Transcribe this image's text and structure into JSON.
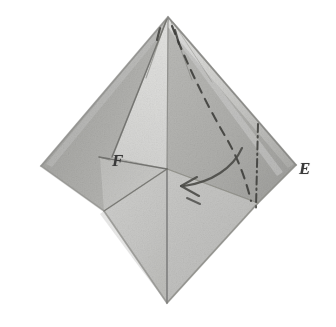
{
  "figure": {
    "kind": "origami-fold-diagram",
    "caption_visible": false,
    "background_color": "#ffffff",
    "labels": [
      {
        "id": "F",
        "text": "F",
        "x": 112,
        "y": 152
      },
      {
        "id": "E",
        "text": "E",
        "x": 299,
        "y": 160
      }
    ],
    "geometry": {
      "apex": [
        168,
        16
      ],
      "left_corner": [
        40,
        166
      ],
      "right_corner": [
        296,
        164
      ],
      "bottom_vertex": [
        167,
        303
      ],
      "center_vertex": [
        167,
        170
      ],
      "f_flap_outer": [
        100,
        158
      ],
      "f_flap_lower": [
        104,
        210
      ]
    },
    "palette": {
      "paper_light": "#dcdcda",
      "paper_midlight": "#cacac8",
      "paper_mid": "#bebebb",
      "paper_midgray": "#b2b2af",
      "paper_gray": "#a6a6a3",
      "paper_dark": "#9b9b98",
      "paper_shadow": "#8e8e8b",
      "crease_line": "#6b6b68",
      "dashed_line": "#4a4a47",
      "arrow_line": "#4f4f4c",
      "label_color": "#3a3a3a",
      "highlight": "#eeeeec"
    },
    "annotations": {
      "dashed_curve": "hidden-edge dashed curve from apex sweeping down to lower right",
      "dash_dot_line": "dash-dot vertical hidden crease on right panel",
      "fold_arrow": "curved arrow indicating fold direction toward the left"
    }
  }
}
